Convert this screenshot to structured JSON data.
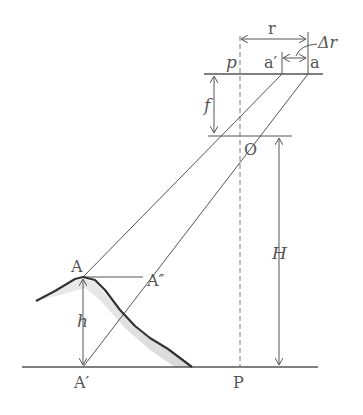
{
  "diagram": {
    "type": "relief-displacement",
    "labels": {
      "principal_point_film": "p",
      "image_point_top": "a′",
      "image_point_base": "a",
      "radial_distance": "r",
      "relief_displacement": "Δr",
      "focal_length": "f",
      "lens_center": "O",
      "flying_height": "H",
      "object_top": "A",
      "projected_point": "A″",
      "object_base": "A′",
      "object_height": "h",
      "ground_nadir": "P"
    },
    "colors": {
      "line": "#555555",
      "heavy_line": "#333333",
      "shade": "#d8d8d8",
      "text": "#555555"
    }
  }
}
